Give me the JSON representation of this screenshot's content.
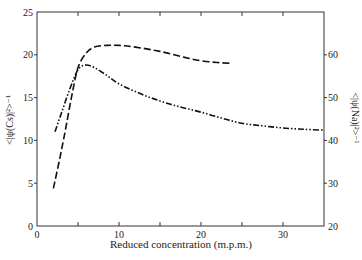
{
  "chart_data": {
    "type": "line",
    "title": "",
    "xlabel": "Reduced concentration (m.p.m.)",
    "ylabel_left": "<|ψ(Cs)|²>⁻¹",
    "ylabel_right": "<|ψ(Na)|²>⁻¹",
    "xlim": [
      0,
      35
    ],
    "ylim_left": [
      0,
      25
    ],
    "ylim_right": [
      20,
      70
    ],
    "x_ticks": [
      0,
      5,
      10,
      15,
      20,
      25,
      30,
      35
    ],
    "x_tick_labels": [
      "0",
      "",
      "10",
      "",
      "20",
      "",
      "30",
      ""
    ],
    "y_left_ticks": [
      0,
      5,
      10,
      15,
      20,
      25
    ],
    "y_left_tick_labels": [
      "0",
      "5",
      "10",
      "15",
      "20",
      "25"
    ],
    "y_right_ticks": [
      20,
      30,
      40,
      50,
      60
    ],
    "y_right_tick_labels": [
      "20",
      "30",
      "40",
      "50",
      "60"
    ],
    "grid": false,
    "legend": "none",
    "series": [
      {
        "name": "<|ψ(Cs)|²>⁻¹",
        "axis": "left",
        "style": "dashed",
        "x": [
          2.0,
          2.8,
          3.5,
          4.2,
          5.0,
          6.0,
          7.0,
          8.5,
          10.0,
          12.0,
          15.0,
          18.0,
          20.0,
          22.0,
          23.7
        ],
        "y": [
          4.4,
          8.0,
          11.4,
          15.0,
          18.5,
          20.2,
          20.9,
          21.1,
          21.1,
          20.9,
          20.4,
          19.7,
          19.3,
          19.1,
          19.0
        ]
      },
      {
        "name": "<|ψ(Na)|²>⁻¹",
        "axis": "right",
        "style": "dash-dot-dot",
        "x": [
          2.2,
          3.0,
          4.0,
          5.0,
          5.9,
          7.0,
          8.5,
          10.0,
          12.5,
          15.0,
          17.5,
          20.0,
          22.5,
          25.0,
          27.5,
          30.0,
          32.5,
          35.0
        ],
        "y": [
          42.0,
          46.5,
          52.0,
          56.5,
          57.6,
          57.0,
          55.2,
          53.2,
          51.0,
          49.2,
          47.8,
          46.6,
          45.2,
          44.0,
          43.4,
          42.9,
          42.6,
          42.4
        ]
      }
    ]
  }
}
